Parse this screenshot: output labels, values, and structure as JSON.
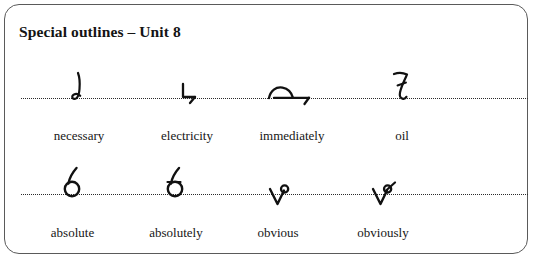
{
  "card": {
    "title": "Special outlines – Unit 8",
    "border_color": "#5a5a5a",
    "background_color": "#ffffff"
  },
  "guide_lines": {
    "style": "dotted",
    "color": "#2b2b2b",
    "count": 2
  },
  "rows": [
    {
      "name": "row-1",
      "items": [
        {
          "word": "necessary",
          "glyph": "shorthand-outline-necessary"
        },
        {
          "word": "electricity",
          "glyph": "shorthand-outline-electricity"
        },
        {
          "word": "immediately",
          "glyph": "shorthand-outline-immediately"
        },
        {
          "word": "oil",
          "glyph": "shorthand-outline-oil"
        }
      ]
    },
    {
      "name": "row-2",
      "items": [
        {
          "word": "absolute",
          "glyph": "shorthand-outline-absolute"
        },
        {
          "word": "absolutely",
          "glyph": "shorthand-outline-absolutely"
        },
        {
          "word": "obvious",
          "glyph": "shorthand-outline-obvious"
        },
        {
          "word": "obviously",
          "glyph": "shorthand-outline-obviously"
        }
      ]
    }
  ]
}
